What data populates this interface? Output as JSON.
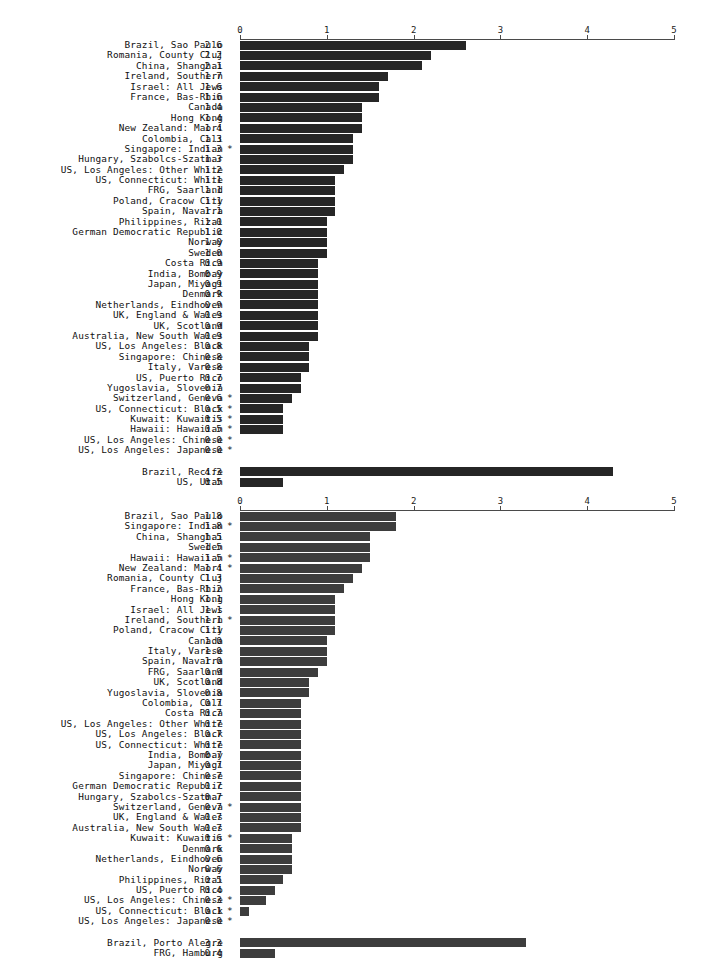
{
  "figure": {
    "background_color": "#ffffff",
    "axis_color": "#4a4a4a",
    "text_color": "#101010"
  },
  "chart_data": [
    {
      "type": "bar",
      "orientation": "horizontal",
      "title": "",
      "subtitle": "",
      "xlabel": "",
      "ylabel": "",
      "xlim": [
        0,
        5
      ],
      "xticks": [
        0,
        1,
        2,
        3,
        4,
        5
      ],
      "xtick_labels": [
        "0",
        "1",
        "2",
        "3",
        "4",
        "5"
      ],
      "grid": false,
      "legend": null,
      "bar_color": "#262626",
      "annotation_marker": "*",
      "categories": [
        "Brazil, Sao Paulo",
        "Romania, County Cluj",
        "China, Shanghai",
        "Ireland, Southern",
        "Israel: All Jews",
        "France, Bas-Rhin",
        "Canada",
        "Hong Kong",
        "New Zealand: Maori",
        "Colombia, Cali",
        "Singapore: Indian",
        "Hungary, Szabolcs-Szatmar",
        "US, Los Angeles: Other White",
        "US, Connecticut: White",
        "FRG, Saarland",
        "Poland, Cracow City",
        "Spain, Navarra",
        "Philippines, Rizal",
        "German Democratic Republic",
        "Norway",
        "Sweden",
        "Costa Rica",
        "India, Bombay",
        "Japan, Miyagi",
        "Denmark",
        "Netherlands, Eindhoven",
        "UK, England & Wales",
        "UK, Scotland",
        "Australia, New South Wales",
        "US, Los Angeles: Black",
        "Singapore: Chinese",
        "Italy, Varese",
        "US, Puerto Rico",
        "Yugoslavia, Slovenia",
        "Switzerland, Geneva",
        "US, Connecticut: Black",
        "Kuwait: Kuwaitis",
        "Hawaii: Hawaiian",
        "US, Los Angeles: Chinese",
        "US, Los Angeles: Japanese"
      ],
      "values": [
        2.6,
        2.2,
        2.1,
        1.7,
        1.6,
        1.6,
        1.4,
        1.4,
        1.4,
        1.3,
        1.3,
        1.3,
        1.2,
        1.1,
        1.1,
        1.1,
        1.1,
        1.0,
        1.0,
        1.0,
        1.0,
        0.9,
        0.9,
        0.9,
        0.9,
        0.9,
        0.9,
        0.9,
        0.9,
        0.8,
        0.8,
        0.8,
        0.7,
        0.7,
        0.6,
        0.5,
        0.5,
        0.5,
        0.0,
        0.0
      ],
      "value_labels": [
        "2.6",
        "2.2",
        "2.1",
        "1.7",
        "1.6",
        "1.6",
        "1.4",
        "1.4",
        "1.4",
        "1.3",
        "1.3",
        "1.3",
        "1.2",
        "1.1",
        "1.1",
        "1.1",
        "1.1",
        "1.0",
        "1.0",
        "1.0",
        "1.0",
        "0.9",
        "0.9",
        "0.9",
        "0.9",
        "0.9",
        "0.9",
        "0.9",
        "0.9",
        "0.8",
        "0.8",
        "0.8",
        "0.7",
        "0.7",
        "0.6",
        "0.5",
        "0.5",
        "0.5",
        "0.0",
        "0.0"
      ],
      "starred": [
        false,
        false,
        false,
        false,
        false,
        false,
        false,
        false,
        false,
        false,
        true,
        false,
        false,
        false,
        false,
        false,
        false,
        false,
        false,
        false,
        false,
        false,
        false,
        false,
        false,
        false,
        false,
        false,
        false,
        false,
        false,
        false,
        false,
        false,
        true,
        true,
        true,
        true,
        true,
        true
      ],
      "extra_group": {
        "categories": [
          "Brazil, Recife",
          "US, Utah"
        ],
        "values": [
          4.3,
          0.5
        ],
        "value_labels": [
          "4.3",
          "0.5"
        ],
        "starred": [
          false,
          false
        ]
      }
    },
    {
      "type": "bar",
      "orientation": "horizontal",
      "title": "",
      "subtitle": "",
      "xlabel": "",
      "ylabel": "",
      "xlim": [
        0,
        5
      ],
      "xticks": [
        0,
        1,
        2,
        3,
        4,
        5
      ],
      "xtick_labels": [
        "0",
        "1",
        "2",
        "3",
        "4",
        "5"
      ],
      "grid": false,
      "legend": null,
      "bar_color": "#3d3d3d",
      "annotation_marker": "*",
      "categories": [
        "Brazil, Sao Paulo",
        "Singapore: Indian",
        "China, Shanghai",
        "Sweden",
        "Hawaii: Hawaiian",
        "New Zealand: Maori",
        "Romania, County Cluj",
        "France, Bas-Rhin",
        "Hong Kong",
        "Israel: All Jews",
        "Ireland, Southern",
        "Poland, Cracow City",
        "Canada",
        "Italy, Varese",
        "Spain, Navarra",
        "FRG, Saarland",
        "UK, Scotland",
        "Yugoslavia, Slovenia",
        "Colombia, Cali",
        "Costa Rica",
        "US, Los Angeles: Other White",
        "US, Los Angeles: Black",
        "US, Connecticut: White",
        "India, Bombay",
        "Japan, Miyagi",
        "Singapore: Chinese",
        "German Democratic Republic",
        "Hungary, Szabolcs-Szatmar",
        "Switzerland, Geneva",
        "UK, England & Wales",
        "Australia, New South Wales",
        "Kuwait: Kuwaitis",
        "Denmark",
        "Netherlands, Eindhoven",
        "Norway",
        "Philippines, Rizal",
        "US, Puerto Rico",
        "US, Los Angeles: Chinese",
        "US, Connecticut: Black",
        "US, Los Angeles: Japanese"
      ],
      "values": [
        1.8,
        1.8,
        1.5,
        1.5,
        1.5,
        1.4,
        1.3,
        1.2,
        1.1,
        1.1,
        1.1,
        1.1,
        1.0,
        1.0,
        1.0,
        0.9,
        0.8,
        0.8,
        0.7,
        0.7,
        0.7,
        0.7,
        0.7,
        0.7,
        0.7,
        0.7,
        0.7,
        0.7,
        0.7,
        0.7,
        0.7,
        0.6,
        0.6,
        0.6,
        0.6,
        0.5,
        0.4,
        0.3,
        0.1,
        0.0
      ],
      "value_labels": [
        "1.8",
        "1.8",
        "1.5",
        "1.5",
        "1.5",
        "1.4",
        "1.3",
        "1.2",
        "1.1",
        "1.1",
        "1.1",
        "1.1",
        "1.0",
        "1.0",
        "1.0",
        "0.9",
        "0.8",
        "0.8",
        "0.7",
        "0.7",
        "0.7",
        "0.7",
        "0.7",
        "0.7",
        "0.7",
        "0.7",
        "0.7",
        "0.7",
        "0.7",
        "0.7",
        "0.7",
        "0.6",
        "0.6",
        "0.6",
        "0.6",
        "0.5",
        "0.4",
        "0.3",
        "0.1",
        "0.0"
      ],
      "starred": [
        false,
        true,
        false,
        false,
        true,
        true,
        false,
        false,
        false,
        false,
        true,
        false,
        false,
        false,
        false,
        false,
        false,
        false,
        false,
        false,
        false,
        false,
        false,
        false,
        false,
        false,
        false,
        false,
        true,
        false,
        false,
        true,
        false,
        false,
        false,
        false,
        false,
        true,
        true,
        true
      ],
      "extra_group": {
        "categories": [
          "Brazil, Porto Alegre",
          "FRG, Hamburg"
        ],
        "values": [
          3.3,
          0.4
        ],
        "value_labels": [
          "3.3",
          "0.4"
        ],
        "starred": [
          false,
          false
        ]
      }
    }
  ]
}
